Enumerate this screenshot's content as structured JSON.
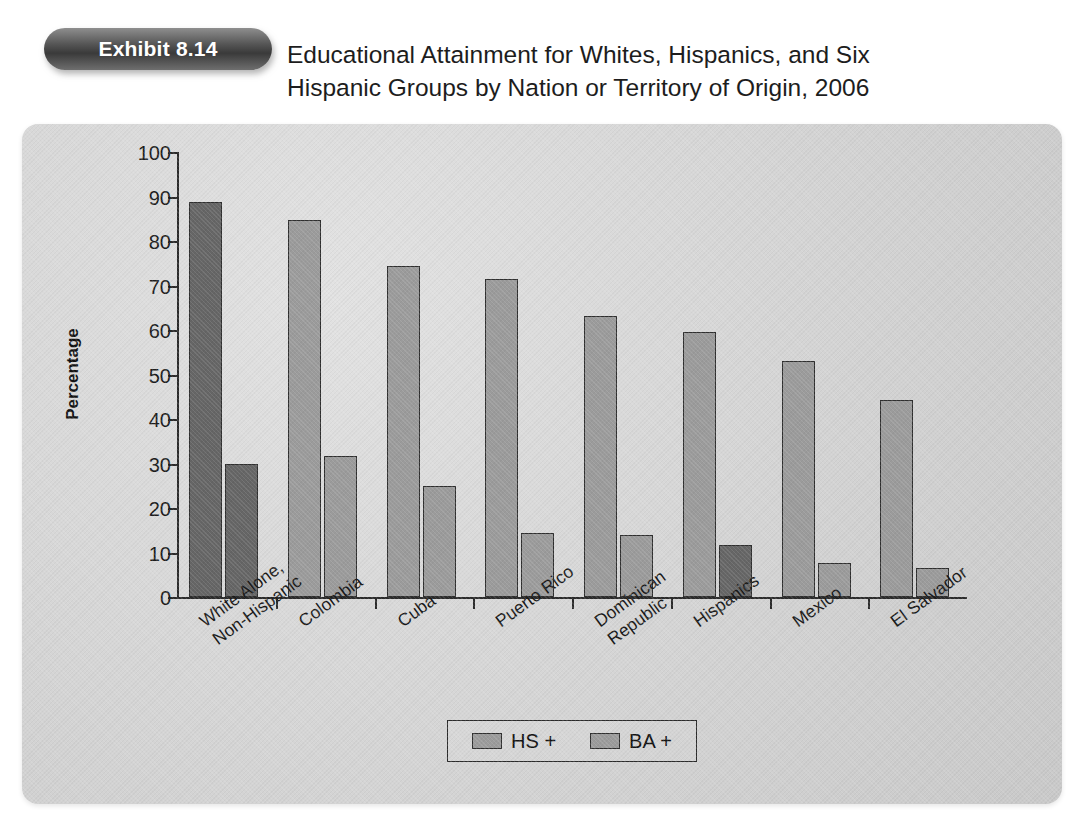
{
  "exhibit": {
    "badge_label": "Exhibit 8.14",
    "title_line1": "Educational Attainment for Whites, Hispanics, and Six",
    "title_line2": "Hispanic Groups by Nation or Territory of Origin, 2006"
  },
  "legend": {
    "items": [
      {
        "label": "HS +",
        "color": "#9b9b9b"
      },
      {
        "label": "BA +",
        "color": "#9b9b9b"
      }
    ]
  },
  "axis": {
    "y_title": "Percentage",
    "y_ticks": [
      "0",
      "10",
      "20",
      "30",
      "40",
      "50",
      "60",
      "70",
      "80",
      "90",
      "100"
    ]
  },
  "categories_display": [
    {
      "line1": "White Alone,",
      "line2": "Non-Hispanic"
    },
    {
      "line1": "Colombia",
      "line2": ""
    },
    {
      "line1": "Cuba",
      "line2": ""
    },
    {
      "line1": "Puerto Rico",
      "line2": ""
    },
    {
      "line1": "Dominican",
      "line2": "Republic"
    },
    {
      "line1": "Hispanics",
      "line2": ""
    },
    {
      "line1": "Mexico",
      "line2": ""
    },
    {
      "line1": "El Salvador",
      "line2": ""
    }
  ],
  "chart_data": {
    "type": "bar",
    "title": "Educational Attainment for Whites, Hispanics, and Six Hispanic Groups by Nation or Territory of Origin, 2006",
    "xlabel": "",
    "ylabel": "Percentage",
    "ylim": [
      0,
      100
    ],
    "ytick_step": 10,
    "grid": false,
    "legend_position": "bottom",
    "categories": [
      "White Alone, Non-Hispanic",
      "Colombia",
      "Cuba",
      "Puerto Rico",
      "Dominican Republic",
      "Hispanics",
      "Mexico",
      "El Salvador"
    ],
    "series": [
      {
        "name": "HS +",
        "values": [
          88.8,
          84.8,
          74.4,
          71.5,
          63.2,
          59.6,
          53.0,
          44.2
        ]
      },
      {
        "name": "BA +",
        "values": [
          30.0,
          31.6,
          25.0,
          14.3,
          14.0,
          11.8,
          7.6,
          6.6
        ]
      }
    ],
    "bar_shades": {
      "default": "#9b9b9b",
      "highlight": "#666666",
      "highlighted_bars": [
        {
          "category": "White Alone, Non-Hispanic",
          "series": "HS +"
        },
        {
          "category": "White Alone, Non-Hispanic",
          "series": "BA +"
        },
        {
          "category": "Hispanics",
          "series": "BA +"
        }
      ]
    }
  }
}
